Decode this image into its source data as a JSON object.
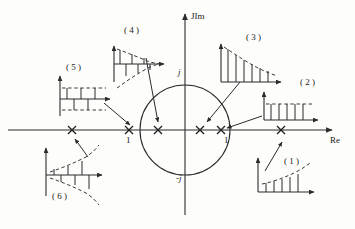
{
  "figure": {
    "type": "z-plane pole-location diagram",
    "axes": {
      "real_axis_label": "Re",
      "imag_axis_label": "JIm",
      "imag_pos_tick": "j",
      "imag_neg_tick": "-j",
      "real_neg_unit_label": "1",
      "real_pos_unit_label": "1"
    },
    "unit_circle": {
      "center": [
        185,
        130
      ],
      "radius": 45,
      "stroke": "#2b2b2b"
    },
    "stroke_color": "#2b2b2b",
    "dashed_color": "#3a3a3a",
    "background": "#fdfdfc"
  },
  "poles": [
    {
      "id": "pole-1",
      "x": 281,
      "y": 130,
      "marker": "x",
      "region": "outside-unit-circle-positive-real",
      "inset": "1"
    },
    {
      "id": "pole-2",
      "x": 221,
      "y": 130,
      "marker": "x",
      "region": "on-unit-circle-positive-real",
      "inset": "2"
    },
    {
      "id": "pole-3",
      "x": 200,
      "y": 130,
      "marker": "x",
      "region": "inside-unit-circle-positive-real",
      "inset": "3"
    },
    {
      "id": "pole-4",
      "x": 158,
      "y": 130,
      "marker": "x",
      "region": "inside-unit-circle-negative-real",
      "inset": "4"
    },
    {
      "id": "pole-5",
      "x": 129,
      "y": 130,
      "marker": "x",
      "region": "on-unit-circle-negative-real",
      "inset": "5"
    },
    {
      "id": "pole-6",
      "x": 72,
      "y": 130,
      "marker": "x",
      "region": "outside-unit-circle-negative-real",
      "inset": "6"
    }
  ],
  "insets": [
    {
      "id": "inset-1",
      "label": "( 1 )",
      "label_x": 291,
      "label_y": 163,
      "origin_x": 256,
      "origin_y": 190,
      "width": 58,
      "height": 38,
      "description": "growing positive stems, increasing dashed envelope",
      "sign": "all-positive",
      "trend": "growing",
      "stem_heights": [
        9,
        11,
        13,
        15,
        18,
        21
      ]
    },
    {
      "id": "inset-2",
      "label": "( 2 )",
      "label_x": 306,
      "label_y": 84,
      "origin_x": 262,
      "origin_y": 118,
      "width": 55,
      "height": 32,
      "description": "constant amplitude positive stems, flat dashed envelope",
      "sign": "all-positive",
      "trend": "constant",
      "stem_heights": [
        16,
        16,
        16,
        16,
        16,
        16
      ]
    },
    {
      "id": "inset-3",
      "label": "( 3 )",
      "label_x": 253,
      "label_y": 39,
      "origin_x": 219,
      "origin_y": 79,
      "width": 60,
      "height": 42,
      "description": "decaying positive stems, decreasing dashed envelope",
      "sign": "all-positive",
      "trend": "decaying",
      "stem_heights": [
        36,
        30,
        25,
        20,
        16,
        13,
        10
      ]
    },
    {
      "id": "inset-4",
      "label": "( 4 )",
      "label_x": 131,
      "label_y": 32,
      "origin_x": 112,
      "origin_y": 61,
      "width": 50,
      "height": 46,
      "description": "alternating-sign decaying stems, converging dashed envelopes",
      "sign": "alternating",
      "trend": "decaying",
      "stem_heights": [
        22,
        16,
        11,
        7,
        4
      ]
    },
    {
      "id": "inset-5",
      "label": "( 5 )",
      "label_x": 72,
      "label_y": 69,
      "origin_x": 58,
      "origin_y": 100,
      "width": 52,
      "height": 34,
      "description": "alternating-sign constant amplitude stems, flat dashed envelopes",
      "sign": "alternating",
      "trend": "constant",
      "stem_heights": [
        12,
        12,
        12,
        12,
        12
      ]
    },
    {
      "id": "inset-6",
      "label": "( 6 )",
      "label_x": 58,
      "label_y": 198,
      "origin_x": 44,
      "origin_y": 176,
      "width": 58,
      "height": 44,
      "description": "alternating-sign growing stems, diverging dashed envelopes",
      "sign": "alternating",
      "trend": "growing",
      "stem_heights": [
        5,
        8,
        12,
        16,
        21
      ]
    }
  ],
  "connectors": [
    {
      "id": "connector-1",
      "from_inset": "1",
      "x1": 265,
      "y1": 171,
      "x2": 283,
      "y2": 141
    },
    {
      "id": "connector-2",
      "from_inset": "2",
      "x1": 264,
      "y1": 117,
      "x2": 226,
      "y2": 129
    },
    {
      "id": "connector-3",
      "from_inset": "3",
      "x1": 239,
      "y1": 81,
      "x2": 206,
      "y2": 122
    },
    {
      "id": "connector-4",
      "from_inset": "4",
      "x1": 146,
      "y1": 58,
      "x2": 158,
      "y2": 124
    },
    {
      "id": "connector-5",
      "from_inset": "5",
      "x1": 104,
      "y1": 102,
      "x2": 131,
      "y2": 126
    },
    {
      "id": "connector-6",
      "from_inset": "6",
      "x1": 88,
      "y1": 156,
      "x2": 74,
      "y2": 138
    }
  ]
}
